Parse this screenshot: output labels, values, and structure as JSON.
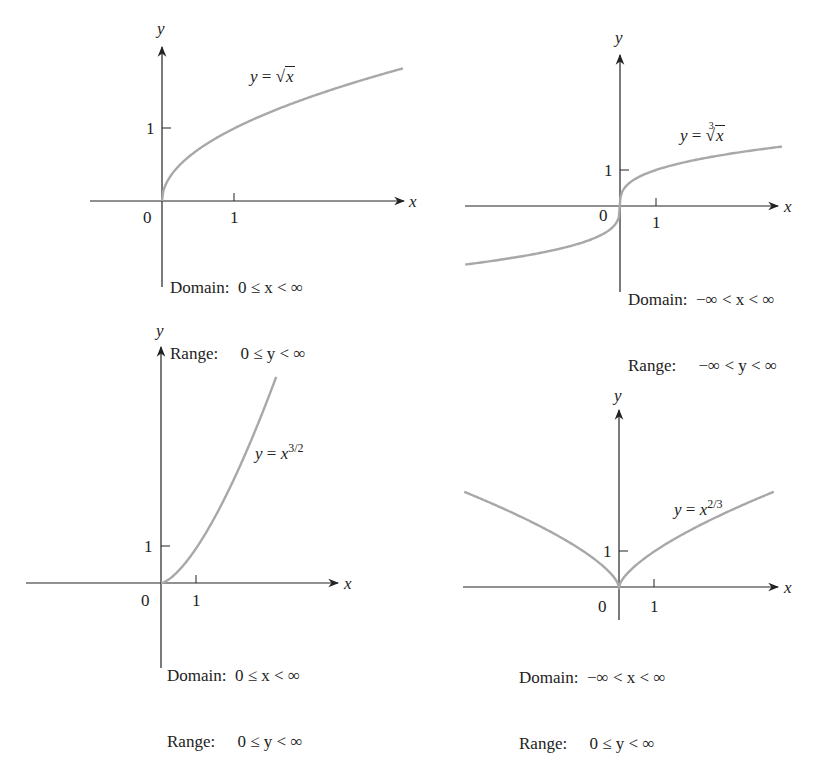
{
  "chart_data": [
    {
      "type": "line",
      "title": "y = √x",
      "function": "sqrt(x)",
      "xlabel": "x",
      "ylabel": "y",
      "x_ticks": [
        0,
        1
      ],
      "y_ticks": [
        1
      ],
      "xlim": [
        -1.0,
        3.3
      ],
      "ylim": [
        -1.2,
        2.1
      ],
      "x": [
        0,
        0.25,
        0.5,
        1,
        1.5,
        2,
        2.5,
        3.3
      ],
      "values": [
        0,
        0.5,
        0.707,
        1,
        1.225,
        1.414,
        1.581,
        1.817
      ],
      "domain": "0 ≤ x < ∞",
      "range": "0 ≤ y < ∞",
      "line_color": "#a8a8a8"
    },
    {
      "type": "line",
      "title": "y = ∛x",
      "function": "cbrt(x)",
      "xlabel": "x",
      "ylabel": "y",
      "x_ticks": [
        0,
        1
      ],
      "y_ticks": [
        1
      ],
      "xlim": [
        -4.3,
        4.5
      ],
      "ylim": [
        -2.3,
        4.6
      ],
      "x": [
        -4.3,
        -3,
        -2,
        -1,
        -0.5,
        0,
        0.5,
        1,
        2,
        3,
        4.3
      ],
      "values": [
        -1.626,
        -1.442,
        -1.26,
        -1,
        -0.794,
        0,
        0.794,
        1,
        1.26,
        1.442,
        1.626
      ],
      "domain": "−∞ < x < ∞",
      "range": "−∞ < y < ∞",
      "line_color": "#a8a8a8"
    },
    {
      "type": "line",
      "title": "y = x^{3/2}",
      "function": "x^(3/2)",
      "xlabel": "x",
      "ylabel": "y",
      "x_ticks": [
        0,
        1
      ],
      "y_ticks": [
        1
      ],
      "xlim": [
        -3.4,
        5.0
      ],
      "ylim": [
        -2.4,
        6.5
      ],
      "x": [
        0,
        0.5,
        1,
        1.5,
        2,
        2.5,
        3,
        3.2
      ],
      "values": [
        0,
        0.354,
        1,
        1.837,
        2.828,
        3.953,
        5.196,
        5.724
      ],
      "domain": "0 ≤ x < ∞",
      "range": "0 ≤ y < ∞",
      "line_color": "#a8a8a8"
    },
    {
      "type": "line",
      "title": "y = x^{2/3}",
      "function": "x^(2/3)",
      "xlabel": "x",
      "ylabel": "y",
      "x_ticks": [
        0,
        1
      ],
      "y_ticks": [
        1
      ],
      "xlim": [
        -4.5,
        4.7
      ],
      "ylim": [
        -1.0,
        5.3
      ],
      "x": [
        -4.3,
        -3,
        -2,
        -1,
        -0.3,
        0,
        0.3,
        1,
        2,
        3,
        4.3
      ],
      "values": [
        2.645,
        2.08,
        1.587,
        1,
        0.448,
        0,
        0.448,
        1,
        1.587,
        2.08,
        2.645
      ],
      "domain": "−∞ < x < ∞",
      "range": "0 ≤ y < ∞",
      "line_color": "#a8a8a8"
    }
  ],
  "panels": [
    {
      "eq_lhs": "y",
      "eq_op": " = ",
      "eq_rad_body": "x",
      "origin_label": "0",
      "xtick_label": "1",
      "ytick_label": "1",
      "x_axis_label": "x",
      "y_axis_label": "y",
      "domain_label": "Domain:",
      "domain_value": "0 ≤ x < ∞",
      "range_label": "Range:",
      "range_value": "0 ≤ y < ∞"
    },
    {
      "eq_lhs": "y",
      "eq_op": " = ",
      "eq_rad_index": "3",
      "eq_rad_body": "x",
      "origin_label": "0",
      "xtick_label": "1",
      "ytick_label": "1",
      "x_axis_label": "x",
      "y_axis_label": "y",
      "domain_label": "Domain:",
      "domain_value": "−∞ < x < ∞",
      "range_label": "Range:",
      "range_value": "−∞ < y < ∞"
    },
    {
      "eq_lhs": "y",
      "eq_op": " = ",
      "eq_base": "x",
      "eq_exp": "3/2",
      "origin_label": "0",
      "xtick_label": "1",
      "ytick_label": "1",
      "x_axis_label": "x",
      "y_axis_label": "y",
      "domain_label": "Domain:",
      "domain_value": "0 ≤ x < ∞",
      "range_label": "Range:",
      "range_value": "0 ≤ y < ∞"
    },
    {
      "eq_lhs": "y",
      "eq_op": " = ",
      "eq_base": "x",
      "eq_exp": "2/3",
      "origin_label": "0",
      "xtick_label": "1",
      "ytick_label": "1",
      "x_axis_label": "x",
      "y_axis_label": "y",
      "domain_label": "Domain:",
      "domain_value": "−∞ < x < ∞",
      "range_label": "Range:",
      "range_value": "0 ≤ y < ∞"
    }
  ]
}
